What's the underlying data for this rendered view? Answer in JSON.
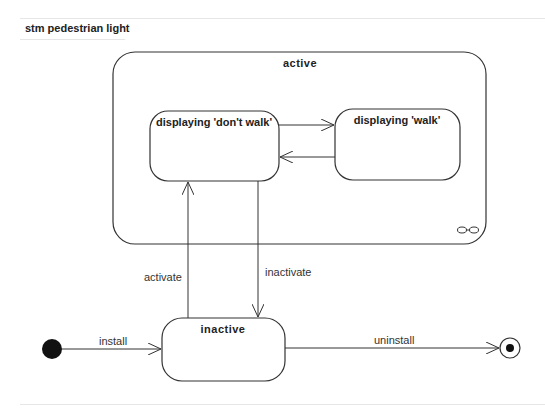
{
  "diagram": {
    "type": "UML state machine",
    "title": "stm pedestrian light",
    "states": [
      {
        "id": "active",
        "label": "active",
        "composite": true,
        "decomposition_icon": "infinity-icon"
      },
      {
        "id": "dont_walk",
        "label": "displaying 'don't walk'",
        "parent": "active"
      },
      {
        "id": "walk",
        "label": "displaying 'walk'",
        "parent": "active"
      },
      {
        "id": "inactive",
        "label": "inactive"
      }
    ],
    "pseudostates": [
      {
        "id": "initial",
        "kind": "initial"
      },
      {
        "id": "final",
        "kind": "final"
      }
    ],
    "transitions": [
      {
        "from": "initial",
        "to": "inactive",
        "label": "install"
      },
      {
        "from": "inactive",
        "to": "dont_walk",
        "label": "activate"
      },
      {
        "from": "dont_walk",
        "to": "inactive",
        "label": "inactivate"
      },
      {
        "from": "dont_walk",
        "to": "walk",
        "label": ""
      },
      {
        "from": "walk",
        "to": "dont_walk",
        "label": ""
      },
      {
        "from": "inactive",
        "to": "final",
        "label": "uninstall"
      }
    ]
  },
  "labels": {
    "title": "stm pedestrian light",
    "active": "active",
    "dont_walk": "displaying 'don't walk'",
    "walk": "displaying 'walk'",
    "inactive": "inactive",
    "install": "install",
    "activate": "activate",
    "inactivate": "inactivate",
    "uninstall": "uninstall"
  },
  "colors": {
    "stroke": "#333333",
    "background": "#ffffff",
    "divider": "#e6e6e6"
  }
}
